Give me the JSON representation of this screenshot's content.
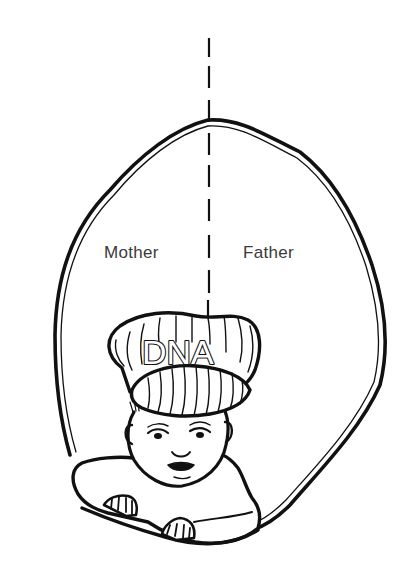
{
  "figure": {
    "labels": {
      "left": "Mother",
      "right": "Father"
    },
    "cap_text": "DNA",
    "elements": [
      "egg-shaped outline (double line)",
      "vertical dashed dividing line",
      "baby wearing striped cap",
      "baby arms/hands resting on outline edge"
    ],
    "colors": {
      "ink": "#111111",
      "label_text": "#3a3a3a",
      "background": "#ffffff"
    }
  }
}
